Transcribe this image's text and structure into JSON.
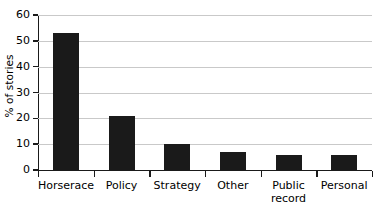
{
  "chart_data": {
    "type": "bar",
    "title": "",
    "xlabel": "",
    "ylabel": "% of stories",
    "categories": [
      "Horserace",
      "Policy",
      "Strategy",
      "Other",
      "Public\nrecord",
      "Personal"
    ],
    "values": [
      53,
      21,
      10,
      7,
      6,
      6
    ],
    "ylim": [
      0,
      60
    ],
    "yticks": [
      0,
      10,
      20,
      30,
      40,
      50,
      60
    ],
    "ytick_labels": [
      "0",
      "10",
      "20",
      "30",
      "40",
      "50",
      "60"
    ],
    "grid": "horizontal",
    "legend": "none",
    "bar_color": "#1a1a1a",
    "gridline_color": "#c9c9c9",
    "axis_color": "#1a1a1a",
    "background_color": "#ffffff"
  }
}
